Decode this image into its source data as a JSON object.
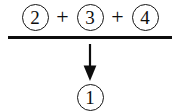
{
  "diagram": {
    "type": "inference-rule",
    "colors": {
      "background": "#ffffff",
      "ink": "#0d0d0d",
      "rule_bar": "#0d0d0d"
    },
    "premises": {
      "items": [
        {
          "label": "2",
          "circled": true
        },
        {
          "label": "3",
          "circled": true
        },
        {
          "label": "4",
          "circled": true
        }
      ],
      "operators": [
        "+",
        "+"
      ]
    },
    "rule_bar": {
      "name": "horizontal-inference-bar",
      "thickness_px": 3
    },
    "arrow": {
      "name": "down-arrow",
      "direction": "down"
    },
    "conclusion": {
      "items": [
        {
          "label": "1",
          "circled": true
        }
      ]
    }
  }
}
